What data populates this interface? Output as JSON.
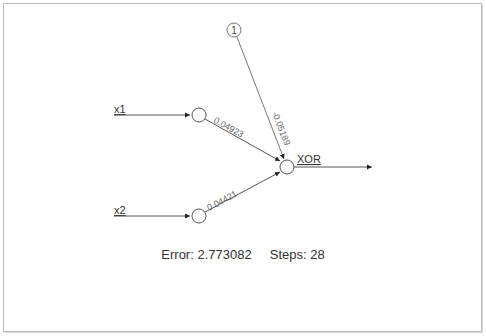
{
  "diagram": {
    "inputs": [
      {
        "label": "x1"
      },
      {
        "label": "x2"
      }
    ],
    "bias": {
      "label": "1"
    },
    "output": {
      "label": "XOR"
    },
    "weights": {
      "x1_to_out": "0.04923",
      "x2_to_out": "0.04421",
      "bias_to_out": "-0.05189"
    },
    "colors": {
      "line": "#555555",
      "node_stroke": "#555555",
      "text": "#333333",
      "weight_text": "#666666"
    }
  },
  "status": {
    "error_label": "Error:",
    "error_value": "2.773082",
    "steps_label": "Steps:",
    "steps_value": "28"
  }
}
